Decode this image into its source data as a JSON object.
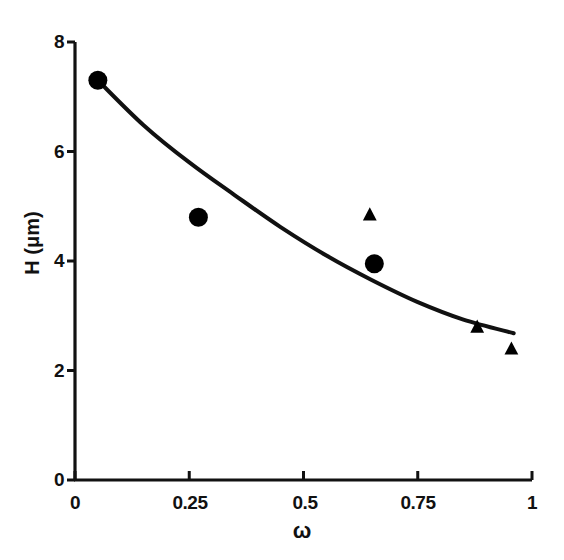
{
  "chart_data": {
    "type": "scatter",
    "title": "",
    "subtitle": "",
    "xlabel": "ω",
    "ylabel": "H (μm)",
    "xlim": [
      0,
      1
    ],
    "ylim": [
      0,
      8
    ],
    "xticks": [
      0,
      0.25,
      0.5,
      0.75,
      1
    ],
    "xtick_labels": [
      "0",
      "0.25",
      "0.5",
      "0.75",
      "1"
    ],
    "yticks": [
      0,
      2,
      4,
      6,
      8
    ],
    "ytick_labels": [
      "0",
      "2",
      "4",
      "6",
      "8"
    ],
    "grid": false,
    "legend": null,
    "series": [
      {
        "name": "circles",
        "marker": "circle",
        "color": "#000000",
        "points": [
          {
            "x": 0.05,
            "y": 7.3
          },
          {
            "x": 0.27,
            "y": 4.8
          },
          {
            "x": 0.655,
            "y": 3.95
          }
        ]
      },
      {
        "name": "triangles",
        "marker": "triangle",
        "color": "#000000",
        "points": [
          {
            "x": 0.645,
            "y": 4.85
          },
          {
            "x": 0.88,
            "y": 2.8
          },
          {
            "x": 0.955,
            "y": 2.4
          }
        ]
      },
      {
        "name": "fit-curve",
        "marker": "none",
        "color": "#000000",
        "points": [
          {
            "x": 0.05,
            "y": 7.3
          },
          {
            "x": 0.15,
            "y": 6.48
          },
          {
            "x": 0.25,
            "y": 5.8
          },
          {
            "x": 0.35,
            "y": 5.2
          },
          {
            "x": 0.45,
            "y": 4.62
          },
          {
            "x": 0.55,
            "y": 4.1
          },
          {
            "x": 0.65,
            "y": 3.65
          },
          {
            "x": 0.75,
            "y": 3.25
          },
          {
            "x": 0.85,
            "y": 2.93
          },
          {
            "x": 0.96,
            "y": 2.68
          }
        ]
      }
    ]
  },
  "axes": {
    "y_label_text": "H (μm)",
    "x_label_text": "ω",
    "ytick_0": "0",
    "ytick_1": "2",
    "ytick_2": "4",
    "ytick_3": "6",
    "ytick_4": "8",
    "xtick_0": "0",
    "xtick_1": "0.25",
    "xtick_2": "0.5",
    "xtick_3": "0.75",
    "xtick_4": "1"
  },
  "colors": {
    "ink": "#111111",
    "background": "#ffffff"
  }
}
